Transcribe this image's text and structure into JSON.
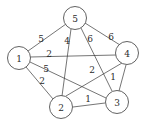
{
  "figure": {
    "kind": "weighted-undirected-graph",
    "background_color": "#ffffff",
    "stroke_color": "#3a3a3a",
    "text_color": "#2b2b2b",
    "width": 146,
    "height": 125
  },
  "chart_data": {
    "type": "diagram",
    "title": "",
    "xlabel": "",
    "ylabel": "",
    "graph_kind": "complete weighted graph K5",
    "node_count": 5,
    "edge_count": 10,
    "nodes": [
      {
        "id": "5",
        "label": "5",
        "cx": 75,
        "cy": 18,
        "r": 11.5
      },
      {
        "id": "1",
        "label": "1",
        "cx": 19,
        "cy": 58,
        "r": 11.5
      },
      {
        "id": "4",
        "label": "4",
        "cx": 127,
        "cy": 53,
        "r": 11.5
      },
      {
        "id": "2",
        "label": "2",
        "cx": 61,
        "cy": 107,
        "r": 11.5
      },
      {
        "id": "3",
        "label": "3",
        "cx": 117,
        "cy": 102,
        "r": 11.5
      }
    ],
    "edges": [
      {
        "from": "1",
        "to": "5",
        "weight": "5",
        "x1": 28,
        "y1": 51,
        "x2": 66,
        "y2": 24,
        "lx": 41,
        "ly": 39
      },
      {
        "from": "5",
        "to": "2",
        "weight": "4",
        "x1": 71,
        "y1": 29,
        "x2": 62,
        "y2": 96,
        "lx": 67,
        "ly": 41
      },
      {
        "from": "5",
        "to": "3",
        "weight": "6",
        "x1": 81,
        "y1": 28,
        "x2": 112,
        "y2": 91,
        "lx": 90,
        "ly": 39
      },
      {
        "from": "5",
        "to": "4",
        "weight": "6",
        "x1": 85,
        "y1": 23,
        "x2": 120,
        "y2": 45,
        "lx": 111,
        "ly": 37
      },
      {
        "from": "1",
        "to": "4",
        "weight": "2",
        "x1": 30,
        "y1": 57,
        "x2": 116,
        "y2": 55,
        "lx": 49,
        "ly": 54
      },
      {
        "from": "1",
        "to": "3",
        "weight": "5",
        "x1": 30,
        "y1": 62,
        "x2": 106,
        "y2": 98,
        "lx": 46,
        "ly": 69
      },
      {
        "from": "1",
        "to": "2",
        "weight": "2",
        "x1": 26,
        "y1": 67,
        "x2": 53,
        "y2": 99,
        "lx": 42,
        "ly": 81
      },
      {
        "from": "2",
        "to": "4",
        "weight": "2",
        "x1": 66,
        "y1": 96,
        "x2": 122,
        "y2": 63,
        "lx": 92,
        "ly": 70
      },
      {
        "from": "3",
        "to": "4",
        "weight": "1",
        "x1": 119,
        "y1": 91,
        "x2": 126,
        "y2": 65,
        "lx": 113,
        "ly": 77
      },
      {
        "from": "2",
        "to": "3",
        "weight": "1",
        "x1": 73,
        "y1": 107,
        "x2": 105,
        "y2": 103,
        "lx": 88,
        "ly": 99
      }
    ]
  }
}
